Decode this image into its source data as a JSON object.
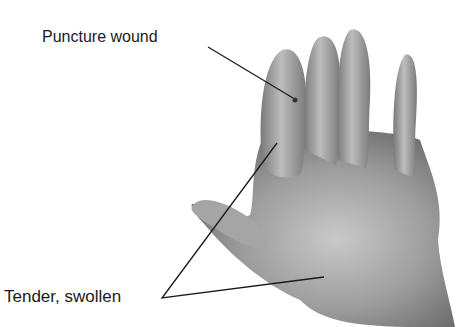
{
  "figure": {
    "title_partial": "",
    "labels": {
      "puncture": "Puncture wound",
      "tender": "Tender, swollen"
    },
    "colors": {
      "skin_light": "#c8c8c8",
      "skin_mid": "#9a9a9a",
      "skin_dark": "#6e6e6e",
      "line": "#1a1a1a"
    }
  }
}
